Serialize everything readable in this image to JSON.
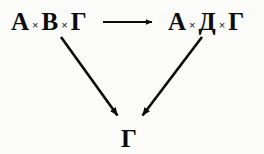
{
  "diagram": {
    "type": "commutative-diagram",
    "background_color": "#fbfbfa",
    "ink_color": "#0b0b0b",
    "nodes": [
      {
        "id": "top-left",
        "position": "top-left",
        "text": "А × В × Г",
        "parts": [
          "А",
          "×",
          "В",
          "×",
          "Г"
        ],
        "x": 11,
        "y": 9
      },
      {
        "id": "top-right",
        "position": "top-right",
        "text": "А × Д × Г",
        "parts": [
          "А",
          "×",
          "Д",
          "×",
          "Г"
        ],
        "x": 168,
        "y": 9
      },
      {
        "id": "bottom",
        "position": "bottom-center",
        "text": "Г",
        "parts": [
          "Г"
        ],
        "x": 121,
        "y": 126
      }
    ],
    "arrows": [
      {
        "id": "arrow-horizontal",
        "name": "arrow-top-left-to-top-right",
        "from": "top-left",
        "to": "top-right",
        "direction": "right",
        "x1": 103,
        "y1": 22,
        "x2": 157,
        "y2": 22
      },
      {
        "id": "arrow-left-diagonal",
        "name": "arrow-top-left-to-bottom",
        "from": "top-left",
        "to": "bottom",
        "direction": "down-right",
        "x1": 61,
        "y1": 37,
        "x2": 122,
        "y2": 122
      },
      {
        "id": "arrow-right-diagonal",
        "name": "arrow-top-right-to-bottom",
        "from": "top-right",
        "to": "bottom",
        "direction": "down-left",
        "x1": 202,
        "y1": 37,
        "x2": 138,
        "y2": 122
      }
    ]
  }
}
